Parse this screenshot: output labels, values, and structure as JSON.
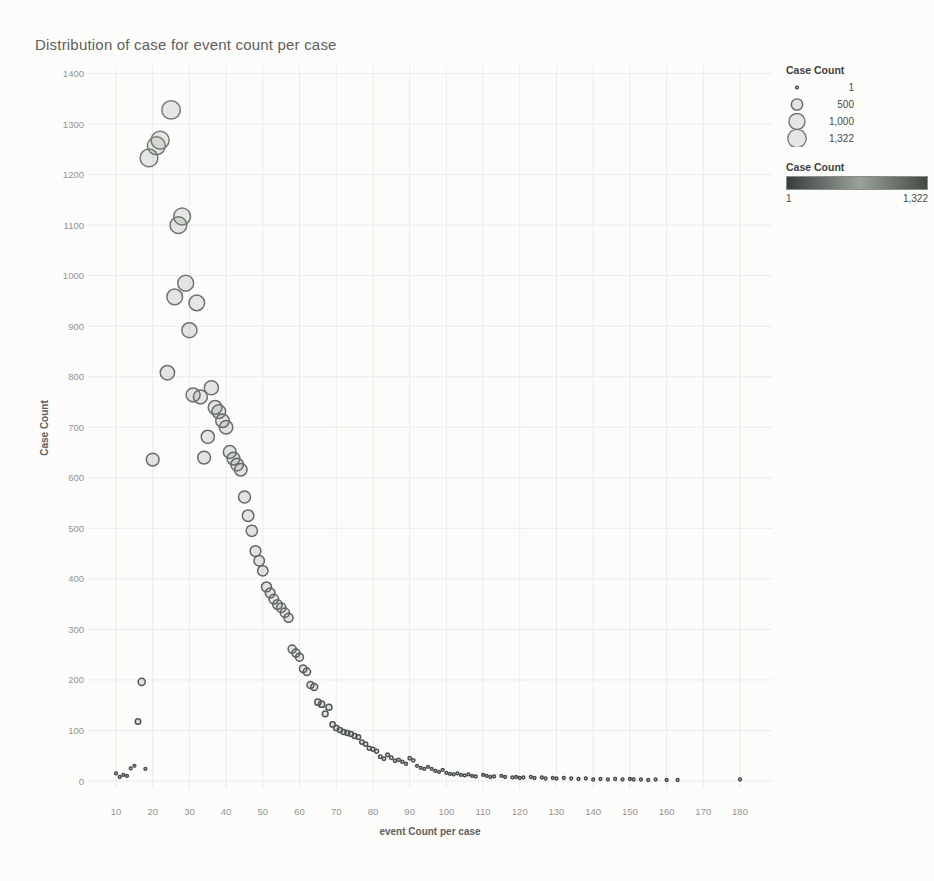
{
  "title": "Distribution of case for event count per case",
  "chart_data": {
    "type": "scatter",
    "title": "Distribution of case for event count per case",
    "xlabel": "event Count per case",
    "ylabel": "Case Count",
    "size_encoding": "Case Count",
    "color_encoding": "Case Count",
    "grid": true,
    "x_ticks": [
      10,
      20,
      30,
      40,
      50,
      60,
      70,
      80,
      90,
      100,
      110,
      120,
      130,
      140,
      150,
      160,
      170,
      180
    ],
    "y_ticks": [
      0,
      100,
      200,
      300,
      400,
      500,
      600,
      700,
      800,
      900,
      1000,
      1100,
      1200,
      1300,
      1400
    ],
    "xlim": [
      2,
      188
    ],
    "ylim": [
      -20,
      1415
    ],
    "size_domain": [
      1,
      1322
    ],
    "points": [
      [
        10,
        15
      ],
      [
        11,
        8
      ],
      [
        12,
        12
      ],
      [
        13,
        10
      ],
      [
        14,
        25
      ],
      [
        15,
        30
      ],
      [
        16,
        118
      ],
      [
        17,
        196
      ],
      [
        18,
        24
      ],
      [
        19,
        1233
      ],
      [
        20,
        636
      ],
      [
        21,
        1257
      ],
      [
        22,
        1268
      ],
      [
        24,
        808
      ],
      [
        25,
        1328
      ],
      [
        26,
        958
      ],
      [
        27,
        1100
      ],
      [
        28,
        1117
      ],
      [
        29,
        985
      ],
      [
        30,
        892
      ],
      [
        31,
        764
      ],
      [
        32,
        946
      ],
      [
        33,
        760
      ],
      [
        34,
        640
      ],
      [
        35,
        681
      ],
      [
        36,
        778
      ],
      [
        37,
        739
      ],
      [
        38,
        731
      ],
      [
        39,
        713
      ],
      [
        40,
        700
      ],
      [
        41,
        651
      ],
      [
        42,
        638
      ],
      [
        43,
        626
      ],
      [
        44,
        616
      ],
      [
        45,
        562
      ],
      [
        46,
        525
      ],
      [
        47,
        495
      ],
      [
        48,
        455
      ],
      [
        49,
        436
      ],
      [
        50,
        416
      ],
      [
        51,
        384
      ],
      [
        52,
        372
      ],
      [
        53,
        360
      ],
      [
        54,
        349
      ],
      [
        55,
        343
      ],
      [
        56,
        333
      ],
      [
        57,
        323
      ],
      [
        58,
        261
      ],
      [
        59,
        253
      ],
      [
        60,
        245
      ],
      [
        61,
        222
      ],
      [
        62,
        216
      ],
      [
        63,
        190
      ],
      [
        64,
        186
      ],
      [
        65,
        156
      ],
      [
        66,
        152
      ],
      [
        67,
        133
      ],
      [
        68,
        146
      ],
      [
        69,
        112
      ],
      [
        70,
        105
      ],
      [
        71,
        101
      ],
      [
        72,
        97
      ],
      [
        73,
        95
      ],
      [
        74,
        93
      ],
      [
        75,
        89
      ],
      [
        76,
        87
      ],
      [
        77,
        77
      ],
      [
        78,
        73
      ],
      [
        79,
        65
      ],
      [
        80,
        63
      ],
      [
        81,
        59
      ],
      [
        82,
        48
      ],
      [
        83,
        44
      ],
      [
        84,
        52
      ],
      [
        85,
        46
      ],
      [
        86,
        40
      ],
      [
        87,
        42
      ],
      [
        88,
        38
      ],
      [
        89,
        34
      ],
      [
        90,
        45
      ],
      [
        91,
        41
      ],
      [
        92,
        30
      ],
      [
        93,
        26
      ],
      [
        94,
        24
      ],
      [
        95,
        28
      ],
      [
        96,
        24
      ],
      [
        97,
        20
      ],
      [
        98,
        18
      ],
      [
        99,
        22
      ],
      [
        100,
        16
      ],
      [
        101,
        14
      ],
      [
        102,
        13
      ],
      [
        103,
        15
      ],
      [
        104,
        12
      ],
      [
        105,
        11
      ],
      [
        106,
        13
      ],
      [
        107,
        10
      ],
      [
        108,
        9
      ],
      [
        110,
        12
      ],
      [
        111,
        10
      ],
      [
        112,
        8
      ],
      [
        113,
        9
      ],
      [
        115,
        10
      ],
      [
        116,
        8
      ],
      [
        118,
        7
      ],
      [
        119,
        8
      ],
      [
        120,
        6
      ],
      [
        121,
        7
      ],
      [
        123,
        8
      ],
      [
        124,
        6
      ],
      [
        126,
        7
      ],
      [
        127,
        5
      ],
      [
        129,
        6
      ],
      [
        130,
        5
      ],
      [
        132,
        6
      ],
      [
        134,
        5
      ],
      [
        136,
        4
      ],
      [
        138,
        5
      ],
      [
        140,
        3
      ],
      [
        142,
        4
      ],
      [
        144,
        3
      ],
      [
        146,
        4
      ],
      [
        148,
        3
      ],
      [
        150,
        4
      ],
      [
        151,
        3
      ],
      [
        153,
        3
      ],
      [
        155,
        2
      ],
      [
        157,
        3
      ],
      [
        160,
        2
      ],
      [
        163,
        2
      ],
      [
        180,
        3
      ]
    ]
  },
  "legend": {
    "size": {
      "title": "Case Count",
      "items": [
        {
          "value": 1,
          "label": "1"
        },
        {
          "value": 500,
          "label": "500"
        },
        {
          "value": 1000,
          "label": "1,000"
        },
        {
          "value": 1322,
          "label": "1,322"
        }
      ]
    },
    "color": {
      "title": "Case Count",
      "min_label": "1",
      "max_label": "1,322",
      "gradient": [
        "#373c3d",
        "#99a399",
        "#434a44"
      ]
    }
  },
  "colors": {
    "background": "#fcfcfa",
    "grid": "#ebebe8",
    "tick_text": "#949492",
    "title_text": "#5f5f5f",
    "axis_label_text": "#606060",
    "marker_stroke_dark": "#41464a",
    "marker_stroke_light": "#7e877f"
  }
}
